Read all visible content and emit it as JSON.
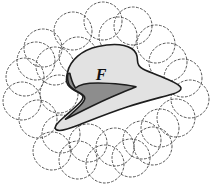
{
  "figure": {
    "title": "Region F covered by dashed circles",
    "background_color": "#ffffff",
    "width": 223,
    "height": 188
  },
  "labels": {
    "region": "F",
    "region_font_size": 16,
    "region_x": 101,
    "region_y": 76
  },
  "colors": {
    "region_fill": "#e2e2e2",
    "notch_fill": "#8d8d8d",
    "outline": "#1d1d1d",
    "circle_stroke": "#555555",
    "background": "#ffffff"
  },
  "strokes": {
    "outline_width": 1.6,
    "circle_width": 1.0,
    "circle_dash": "2 2.2"
  },
  "region_outline_path": "M 67.5 72.5 C 70 60 82 50 98 46.5 C 112 43.5 124 44 131.5 48.5 C 136 51.2 137.5 55 137.5 60.5 C 137.5 64.5 139 67 143 69 C 150 72.5 160 76 168 79.5 C 176 83 180.5 85.5 181 88 C 181.5 90.5 178 92.5 171 94.5 C 160 97.6 144 101.5 127 107 C 110 112.5 94 119 80 124.5 C 70.5 128.2 63.5 130.5 59.5 130.5 C 56 130.5 54.5 129 55.5 126.5 C 56.5 124 59.5 121 63.5 117.5 C 68.5 113 74.5 108 78.5 104 C 81.5 101 83 98.8 83 97 C 83 95.2 81.5 94 78.5 92.5 C 74.5 90.5 70 88 68 85 C 66.3 82.4 66 77.8 67.5 72.5 Z",
  "notch_path": "M 67.8 73.5 C 67.2 78.5 67.8 82.5 69.5 85.2 C 71.5 88.2 75.5 90.6 79.5 92.8 C 83 94.7 84.8 96.2 84.8 98.2 C 84.8 100.2 83 102.6 80 105.8 C 76 110 70 115 65.5 119.2 C 70 117 76 114 82.5 110.8 C 95 104.5 110 97.5 121 93 C 129 89.7 134 87.8 136 86.8 C 133 86 128 85.2 122 84.5 C 113 83.5 104.5 83 98 83 C 92 83 87 83.4 83.5 84.2 C 79.5 85.1 77 86.5 75.5 88 C 74.2 86.2 73 84 72 81 C 71 78 70.2 75.5 69.8 73.2 Z",
  "circles": [
    {
      "cx": 73,
      "cy": 31,
      "r": 19
    },
    {
      "cx": 103,
      "cy": 21,
      "r": 19
    },
    {
      "cx": 133,
      "cy": 26,
      "r": 19
    },
    {
      "cx": 156,
      "cy": 44,
      "r": 19
    },
    {
      "cx": 43,
      "cy": 48,
      "r": 19
    },
    {
      "cx": 55,
      "cy": 66,
      "r": 19
    },
    {
      "cx": 168,
      "cy": 62,
      "r": 19
    },
    {
      "cx": 183,
      "cy": 78,
      "r": 19
    },
    {
      "cx": 25,
      "cy": 77,
      "r": 19
    },
    {
      "cx": 190,
      "cy": 99,
      "r": 19
    },
    {
      "cx": 22,
      "cy": 101,
      "r": 19
    },
    {
      "cx": 38,
      "cy": 119,
      "r": 19
    },
    {
      "cx": 176,
      "cy": 118,
      "r": 19
    },
    {
      "cx": 61,
      "cy": 134,
      "r": 19
    },
    {
      "cx": 88,
      "cy": 143,
      "r": 19
    },
    {
      "cx": 115,
      "cy": 147,
      "r": 19
    },
    {
      "cx": 142,
      "cy": 140,
      "r": 19
    },
    {
      "cx": 160,
      "cy": 128,
      "r": 19
    },
    {
      "cx": 52,
      "cy": 151,
      "r": 19
    },
    {
      "cx": 78,
      "cy": 160,
      "r": 19
    },
    {
      "cx": 105,
      "cy": 164,
      "r": 19
    },
    {
      "cx": 131,
      "cy": 158,
      "r": 19
    },
    {
      "cx": 153,
      "cy": 146,
      "r": 19
    },
    {
      "cx": 59,
      "cy": 94,
      "r": 19
    },
    {
      "cx": 78,
      "cy": 56,
      "r": 19
    },
    {
      "cx": 118,
      "cy": 36,
      "r": 19
    },
    {
      "cx": 36,
      "cy": 61,
      "r": 19
    }
  ]
}
